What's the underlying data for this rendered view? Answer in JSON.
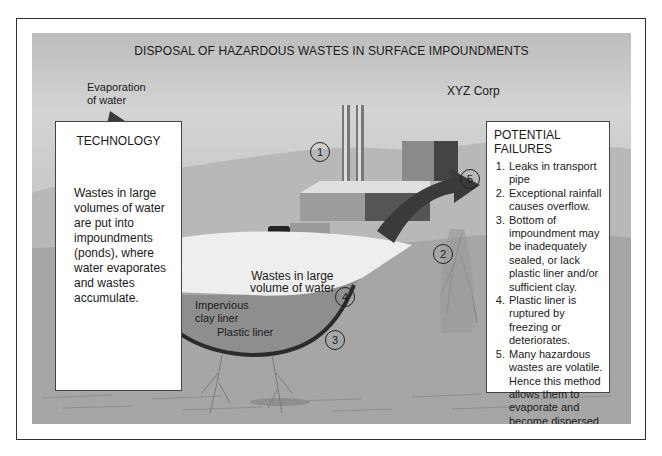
{
  "title": "DISPOSAL OF HAZARDOUS WASTES IN SURFACE IMPOUNDMENTS",
  "labels": {
    "evaporation": "Evaporation\nof water",
    "company": "XYZ Corp",
    "pond": "Wastes in large\nvolume of water",
    "clay_liner": "Impervious\nclay liner",
    "plastic_liner": "Plastic liner",
    "groundwater": "Groundwater"
  },
  "markers": [
    "1",
    "2",
    "3",
    "4",
    "5"
  ],
  "technology": {
    "heading": "TECHNOLOGY",
    "body": "Wastes in large volumes of water are put into impoundments (ponds), where water evaporates and wastes accumulate."
  },
  "potential_failures": {
    "heading": "POTENTIAL FAILURES",
    "items": [
      "Leaks in transport pipe",
      "Exceptional rainfall causes overflow.",
      "Bottom of impoundment may be inadequately sealed, or lack plastic liner and/or sufficient clay.",
      "Plastic liner is ruptured by freezing or deteriorates.",
      "Many hazardous wastes are volatile. Hence this method allows them to evaporate and become dispersed in the environment."
    ]
  },
  "colors": {
    "arrow": "#3a3a3a",
    "liner": "#2b2b2b",
    "pond_water": "#8e8e8e",
    "ground": "#a9a9a9",
    "hills": "#b3b3b3"
  }
}
